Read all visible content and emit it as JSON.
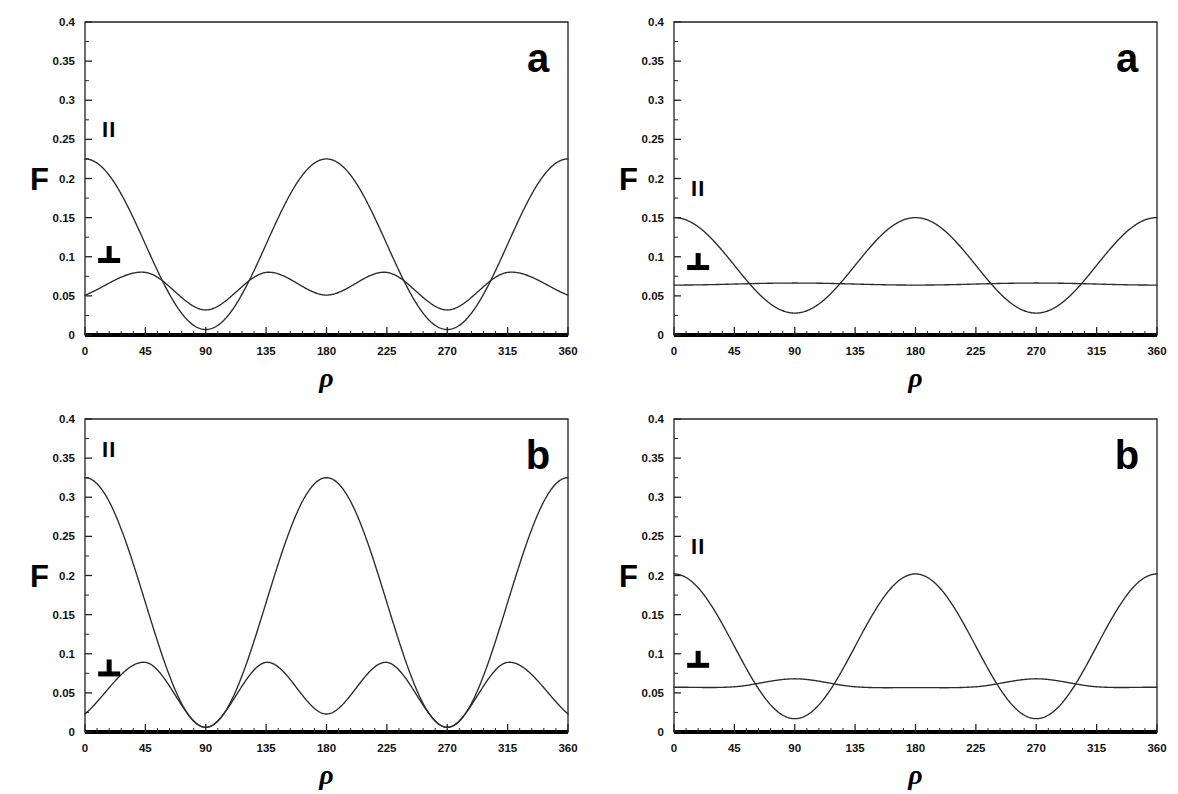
{
  "figure": {
    "title": "",
    "panel_count": 4,
    "background_color": "#ffffff",
    "curve_color": "#2b2b2b"
  },
  "axes": {
    "x_label": "ρ",
    "y_label": "F",
    "x_ticks": [
      0,
      45,
      90,
      135,
      180,
      225,
      270,
      315,
      360
    ],
    "x_tick_labels": [
      "0",
      "45",
      "90",
      "135",
      "180",
      "225",
      "270",
      "315",
      "360"
    ],
    "y_ticks": [
      0,
      0.05,
      0.1,
      0.15,
      0.2,
      0.25,
      0.3,
      0.35,
      0.4
    ],
    "y_tick_labels": [
      "0",
      "0.05",
      "0.1",
      "0.15",
      "0.2",
      "0.25",
      "0.3",
      "0.35",
      "0.4"
    ],
    "xlim": [
      0,
      360
    ],
    "ylim": [
      0,
      0.4
    ],
    "x_minor_per_major": 5,
    "grid": false
  },
  "series_labels": {
    "parallel": "II",
    "perpendicular": "⊥"
  },
  "chart_data": [
    {
      "id": "panel-top-left",
      "type": "line",
      "panel_letter": "a",
      "title": "",
      "xlabel": "ρ",
      "ylabel": "F",
      "xlim": [
        0,
        360
      ],
      "ylim": [
        0,
        0.4
      ],
      "grid": false,
      "legend_position": "inside-left",
      "series": [
        {
          "name": "II",
          "label": "II",
          "label_x": 18,
          "label_y": 0.253,
          "model": "cos2",
          "baseline": 0.116,
          "amplitude": 0.109,
          "period": 360,
          "phase": 0,
          "values_at_ticks": [
            0.225,
            0.116,
            0.007,
            0.116,
            0.225,
            0.116,
            0.007,
            0.116,
            0.225
          ],
          "max": 0.225,
          "min": 0.007
        },
        {
          "name": "⊥",
          "label": "⊥",
          "label_x": 18,
          "label_y": 0.092,
          "model": "double-harmonic",
          "baseline": 0.0558,
          "amp1": 0.0095,
          "amp2": 0.0242,
          "values_at_ticks": [
            0.051,
            0.08,
            0.032,
            0.08,
            0.051,
            0.08,
            0.032,
            0.08,
            0.051
          ],
          "max": 0.08,
          "min": 0.032
        }
      ]
    },
    {
      "id": "panel-top-right",
      "type": "line",
      "panel_letter": "a",
      "title": "",
      "xlabel": "ρ",
      "ylabel": "F",
      "xlim": [
        0,
        360
      ],
      "ylim": [
        0,
        0.4
      ],
      "grid": false,
      "legend_position": "inside-left",
      "series": [
        {
          "name": "II",
          "label": "II",
          "label_x": 18,
          "label_y": 0.178,
          "model": "cos2",
          "baseline": 0.089,
          "amplitude": 0.061,
          "period": 360,
          "phase": 0,
          "values_at_ticks": [
            0.15,
            0.089,
            0.028,
            0.089,
            0.15,
            0.089,
            0.028,
            0.089,
            0.15
          ],
          "max": 0.15,
          "min": 0.028
        },
        {
          "name": "⊥",
          "label": "⊥",
          "label_x": 18,
          "label_y": 0.083,
          "model": "flat-with-bumps",
          "baseline": 0.0638,
          "amp1": 0.0,
          "amp2": 0.0026,
          "values_at_ticks": [
            0.064,
            0.0641,
            0.0685,
            0.0641,
            0.0637,
            0.0641,
            0.0685,
            0.0641,
            0.064
          ],
          "max": 0.0685,
          "min": 0.0637
        }
      ]
    },
    {
      "id": "panel-bottom-left",
      "type": "line",
      "panel_letter": "b",
      "title": "",
      "xlabel": "ρ",
      "ylabel": "F",
      "xlim": [
        0,
        360
      ],
      "ylim": [
        0,
        0.4
      ],
      "grid": false,
      "legend_position": "inside-left",
      "series": [
        {
          "name": "II",
          "label": "II",
          "label_x": 18,
          "label_y": 0.352,
          "model": "cos2",
          "baseline": 0.1655,
          "amplitude": 0.1595,
          "period": 360,
          "phase": 0,
          "values_at_ticks": [
            0.325,
            0.166,
            0.006,
            0.166,
            0.325,
            0.166,
            0.006,
            0.166,
            0.325
          ],
          "max": 0.325,
          "min": 0.006
        },
        {
          "name": "⊥",
          "label": "⊥",
          "label_x": 18,
          "label_y": 0.071,
          "model": "double-harmonic",
          "baseline": 0.047,
          "amp1": 0.0205,
          "amp2": 0.0415,
          "values_at_ticks": [
            0.023,
            0.089,
            0.006,
            0.089,
            0.023,
            0.089,
            0.006,
            0.089,
            0.023
          ],
          "max": 0.089,
          "min": 0.006
        }
      ]
    },
    {
      "id": "panel-bottom-right",
      "type": "line",
      "panel_letter": "b",
      "title": "",
      "xlabel": "ρ",
      "ylabel": "F",
      "xlim": [
        0,
        360
      ],
      "ylim": [
        0,
        0.4
      ],
      "grid": false,
      "legend_position": "inside-left",
      "series": [
        {
          "name": "II",
          "label": "II",
          "label_x": 18,
          "label_y": 0.228,
          "model": "cos2",
          "baseline": 0.1095,
          "amplitude": 0.0925,
          "period": 360,
          "phase": 0,
          "values_at_ticks": [
            0.202,
            0.11,
            0.017,
            0.11,
            0.202,
            0.11,
            0.017,
            0.11,
            0.202
          ],
          "max": 0.202,
          "min": 0.017
        },
        {
          "name": "⊥",
          "label": "⊥",
          "label_x": 18,
          "label_y": 0.082,
          "model": "flat-with-bumps",
          "baseline": 0.058,
          "amp1": 0.0,
          "amp2": 0.0055,
          "values_at_ticks": [
            0.0572,
            0.0578,
            0.068,
            0.0578,
            0.0568,
            0.0578,
            0.068,
            0.0578,
            0.0572
          ],
          "max": 0.068,
          "min": 0.0568
        }
      ]
    }
  ]
}
